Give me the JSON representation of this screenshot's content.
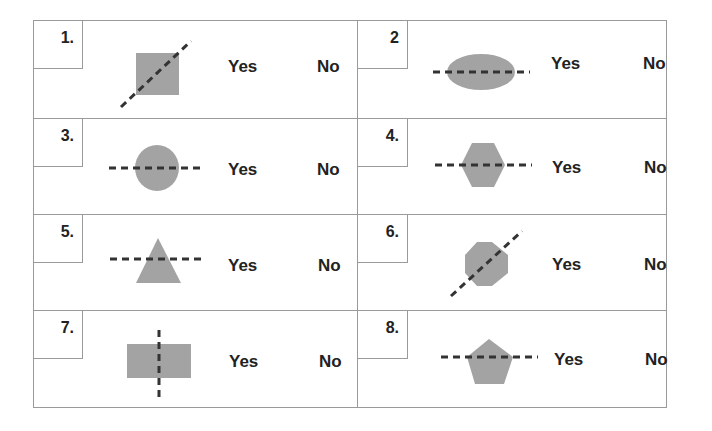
{
  "worksheet": {
    "title": "Line of symmetry worksheet",
    "fill_color": "#a3a3a3",
    "line_color": "#333333",
    "items": [
      {
        "label": "1.",
        "shape": "square",
        "line": "diagonal",
        "yes": "Yes",
        "no": "No"
      },
      {
        "label": "2",
        "shape": "ellipse",
        "line": "horizontal",
        "yes": "Yes",
        "no": "No"
      },
      {
        "label": "3.",
        "shape": "circle",
        "line": "horizontal",
        "yes": "Yes",
        "no": "No"
      },
      {
        "label": "4.",
        "shape": "hexagon",
        "line": "horizontal",
        "yes": "Yes",
        "no": "No"
      },
      {
        "label": "5.",
        "shape": "triangle",
        "line": "horizontal",
        "yes": "Yes",
        "no": "No"
      },
      {
        "label": "6.",
        "shape": "octagon",
        "line": "diagonal",
        "yes": "Yes",
        "no": "No"
      },
      {
        "label": "7.",
        "shape": "rectangle",
        "line": "vertical",
        "yes": "Yes",
        "no": "No"
      },
      {
        "label": "8.",
        "shape": "pentagon",
        "line": "horizontal",
        "yes": "Yes",
        "no": "No"
      }
    ]
  }
}
